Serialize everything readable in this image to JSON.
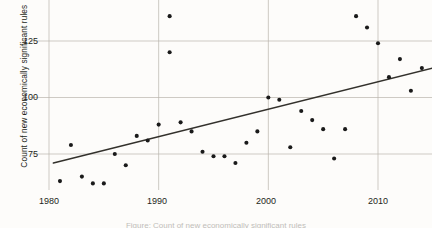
{
  "figure": {
    "caption": "Figure: Count of new economically significant rules"
  },
  "axis": {
    "y_label": "Count of new economically significant rules",
    "y_ticks": [
      "75",
      "100",
      "125"
    ],
    "x_ticks": [
      "1980",
      "1990",
      "2000",
      "2010"
    ]
  },
  "colors": {
    "point": "#1a1a1a",
    "trend": "#33312c",
    "grid": "#b9b5ac",
    "background": "#fdfcfa",
    "text": "#231f20"
  },
  "chart_data": {
    "type": "scatter",
    "title": "",
    "xlabel": "",
    "ylabel": "Count of new economically significant rules",
    "xlim": [
      1979.2,
      2015.6
    ],
    "ylim": [
      54,
      150
    ],
    "xticks": [
      1980,
      1990,
      2000,
      2010
    ],
    "yticks": [
      75,
      100,
      125
    ],
    "grid": true,
    "legend": "none",
    "series": [
      {
        "name": "Count of new economically significant rules",
        "marker": "filled-circle",
        "x": [
          1981,
          1982,
          1983,
          1984,
          1985,
          1986,
          1987,
          1988,
          1989,
          1990,
          1990,
          1991,
          1991,
          1992,
          1993,
          1994,
          1995,
          1996,
          1997,
          1998,
          1999,
          2000,
          2001,
          2002,
          2003,
          2004,
          2005,
          2006,
          2007,
          2008,
          2009,
          2010,
          2011,
          2012,
          2013,
          2014
        ],
        "y": [
          63,
          79,
          65,
          62,
          62,
          75,
          70,
          83,
          81,
          88,
          146,
          136,
          120,
          89,
          85,
          76,
          74,
          74,
          71,
          80,
          85,
          100,
          99,
          78,
          94,
          90,
          86,
          73,
          86,
          136,
          131,
          124,
          109,
          117,
          103,
          113
        ]
      }
    ],
    "trend_line": {
      "type": "linear-fit",
      "x_start": 1980.4,
      "y_start": 71,
      "x_end": 2015.0,
      "y_end": 113
    }
  }
}
